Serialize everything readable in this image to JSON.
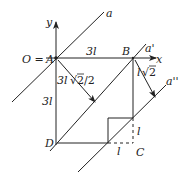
{
  "diagram": {
    "type": "geometry",
    "points": {
      "A": {
        "label": "A",
        "prefix": "O = "
      },
      "B": {
        "label": "B"
      },
      "C": {
        "label": "C"
      },
      "D": {
        "label": "D"
      }
    },
    "axes": {
      "x": "x",
      "y": "y"
    },
    "lines": {
      "a": "a",
      "a_prime": "a'",
      "a_double_prime": "a''"
    },
    "dimensions": {
      "AB": "3l",
      "AD": "3l",
      "dist_A_to_a_prime": "3l√2/2",
      "dist_B_to_a_double_prime": "l√2",
      "corner_horizontal": "l",
      "corner_vertical": "l"
    },
    "labels_text": {
      "o_eq": "O = ",
      "three_l_top": "3l",
      "three_l_left": "3l",
      "diag_left_a": "3l",
      "diag_left_b": "2/2",
      "diag_right_a": "l",
      "diag_right_b": "2",
      "l_horizontal": "l",
      "l_vertical": "l"
    },
    "colors": {
      "stroke": "#222222",
      "background": "#ffffff"
    }
  }
}
